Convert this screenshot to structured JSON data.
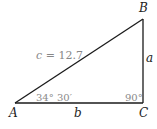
{
  "figure": {
    "type": "right-triangle",
    "vertices": {
      "A": {
        "label": "A",
        "x": 15,
        "y": 103
      },
      "B": {
        "label": "B",
        "x": 143,
        "y": 19
      },
      "C": {
        "label": "C",
        "x": 143,
        "y": 103
      }
    },
    "sides": {
      "a": {
        "label": "a"
      },
      "b": {
        "label": "b"
      },
      "c": {
        "label_var": "c",
        "label_rest": " = 12.7",
        "value": 12.7
      }
    },
    "angles": {
      "A": {
        "label": "34° 30′"
      },
      "C": {
        "label": "90°"
      }
    },
    "colors": {
      "stroke": "#1a1a1a",
      "label": "#222222",
      "annotation": "#888888"
    }
  }
}
